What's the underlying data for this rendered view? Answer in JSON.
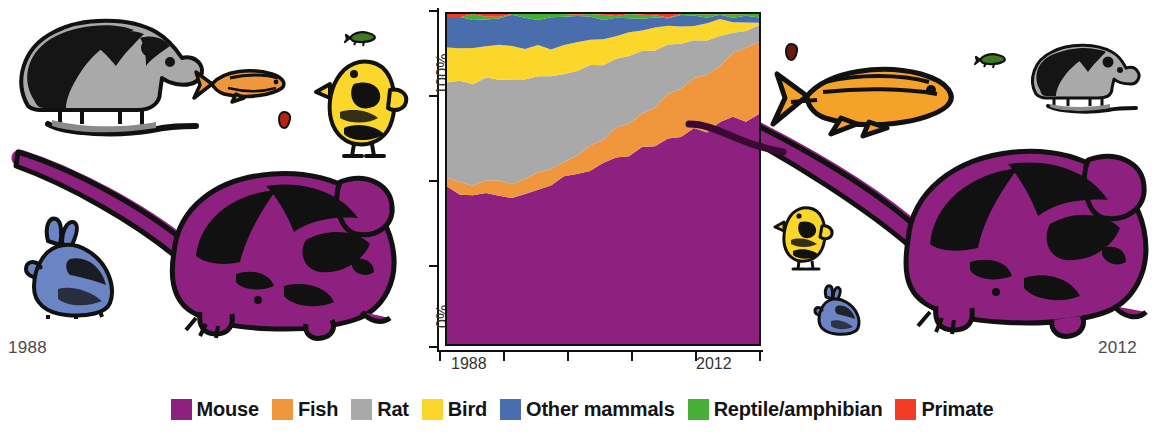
{
  "corner_labels": {
    "left_year": "1988",
    "right_year": "2012"
  },
  "legend": {
    "items": [
      {
        "label": "Mouse",
        "color": "#8E2080",
        "icon": "legend-swatch-mouse"
      },
      {
        "label": "Fish",
        "color": "#F0963C",
        "icon": "legend-swatch-fish"
      },
      {
        "label": "Rat",
        "color": "#A9A9A9",
        "icon": "legend-swatch-rat"
      },
      {
        "label": "Bird",
        "color": "#FBD72B",
        "icon": "legend-swatch-bird"
      },
      {
        "label": "Other mammals",
        "color": "#4A6DAE",
        "icon": "legend-swatch-other-mammals"
      },
      {
        "label": "Reptile/amphibian",
        "color": "#45B035",
        "icon": "legend-swatch-reptile-amphibian"
      },
      {
        "label": "Primate",
        "color": "#F23B22",
        "icon": "legend-swatch-primate"
      }
    ]
  },
  "axes": {
    "y_labels": [
      "100%",
      "0%"
    ],
    "x_labels": [
      "1988",
      "2012"
    ],
    "y_tick_count": 5,
    "x_tick_count": 6
  },
  "chart_data": {
    "type": "area",
    "title": "",
    "xlabel": "",
    "ylabel": "",
    "ylim": [
      0,
      100
    ],
    "stacked": true,
    "normalized": true,
    "grid": false,
    "legend_position": "bottom",
    "x": [
      1988,
      1989,
      1990,
      1991,
      1992,
      1993,
      1994,
      1995,
      1996,
      1997,
      1998,
      1999,
      2000,
      2001,
      2002,
      2003,
      2004,
      2005,
      2006,
      2007,
      2008,
      2009,
      2010,
      2011,
      2012
    ],
    "x_tick_labels": [
      "1988",
      "",
      "",
      "2012"
    ],
    "series": [
      {
        "name": "Mouse",
        "color": "#8E2080",
        "values": [
          47,
          46,
          45,
          46,
          45,
          44,
          46,
          47,
          48,
          50,
          51,
          53,
          54,
          56,
          57,
          59,
          60,
          62,
          63,
          65,
          64,
          67,
          69,
          68,
          70
        ]
      },
      {
        "name": "Fish",
        "color": "#F0963C",
        "values": [
          3,
          3,
          3,
          4,
          4,
          4,
          4,
          5,
          5,
          6,
          6,
          7,
          8,
          9,
          10,
          11,
          12,
          13,
          14,
          15,
          17,
          18,
          19,
          21,
          22
        ]
      },
      {
        "name": "Rat",
        "color": "#A9A9A9",
        "values": [
          30,
          31,
          31,
          30,
          31,
          32,
          30,
          29,
          28,
          26,
          25,
          24,
          23,
          21,
          20,
          18,
          17,
          15,
          14,
          12,
          11,
          9,
          7,
          6,
          4
        ]
      },
      {
        "name": "Bird",
        "color": "#FBD72B",
        "values": [
          10,
          10,
          10,
          10,
          10,
          10,
          10,
          9,
          9,
          9,
          9,
          8,
          8,
          8,
          8,
          7,
          7,
          7,
          6,
          5,
          5,
          4,
          3,
          3,
          2
        ]
      },
      {
        "name": "Other mammals",
        "color": "#4A6DAE",
        "values": [
          9,
          9,
          10,
          9,
          9,
          9,
          9,
          9,
          9,
          8,
          8,
          7,
          6,
          5,
          4,
          4,
          3,
          2,
          2,
          2,
          2,
          1,
          1,
          1,
          1
        ]
      },
      {
        "name": "Reptile/amphibian",
        "color": "#45B035",
        "values": [
          0.7,
          0.7,
          0.7,
          0.7,
          0.7,
          0.7,
          0.7,
          0.7,
          0.7,
          0.7,
          0.7,
          0.7,
          0.7,
          0.7,
          0.7,
          0.7,
          0.7,
          0.7,
          0.7,
          0.7,
          0.7,
          0.7,
          0.7,
          0.7,
          0.7
        ]
      },
      {
        "name": "Primate",
        "color": "#F23B22",
        "values": [
          0.3,
          0.3,
          0.3,
          0.3,
          0.3,
          0.3,
          0.3,
          0.3,
          0.3,
          0.3,
          0.3,
          0.3,
          0.3,
          0.3,
          0.3,
          0.3,
          0.3,
          0.3,
          0.3,
          0.3,
          0.3,
          0.3,
          0.3,
          0.3,
          0.3
        ]
      }
    ]
  },
  "illustrations": {
    "left_group": {
      "year": "1988",
      "animals": [
        {
          "name": "rat",
          "color": "#A9A9A9",
          "size": "large"
        },
        {
          "name": "fish",
          "color": "#F0963C",
          "size": "small"
        },
        {
          "name": "bird",
          "color": "#FBD72B",
          "size": "medium"
        },
        {
          "name": "reptile",
          "color": "#3F7A22",
          "size": "tiny"
        },
        {
          "name": "primate",
          "color": "#B32417",
          "size": "tiny"
        },
        {
          "name": "rabbit",
          "color": "#6B85C4",
          "size": "small"
        },
        {
          "name": "mouse",
          "color": "#8E2080",
          "size": "xlarge"
        }
      ]
    },
    "right_group": {
      "year": "2012",
      "animals": [
        {
          "name": "fish",
          "color": "#F5A22A",
          "size": "large"
        },
        {
          "name": "rat",
          "color": "#A9A9A9",
          "size": "small"
        },
        {
          "name": "reptile",
          "color": "#3F7A22",
          "size": "tiny"
        },
        {
          "name": "primate",
          "color": "#6B1A10",
          "size": "tiny"
        },
        {
          "name": "bird",
          "color": "#FBD72B",
          "size": "small"
        },
        {
          "name": "rabbit",
          "color": "#6B85C4",
          "size": "tiny"
        },
        {
          "name": "mouse",
          "color": "#8E2080",
          "size": "xlarge"
        }
      ]
    }
  }
}
